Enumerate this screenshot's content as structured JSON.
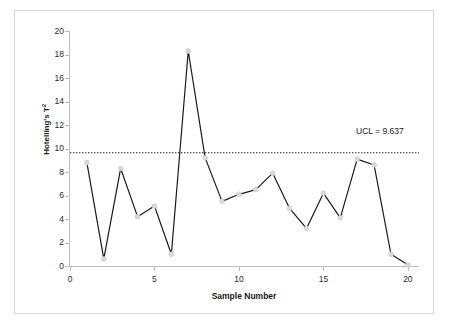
{
  "chart_data": {
    "type": "line",
    "title": "",
    "xlabel": "Sample Number",
    "ylabel": "Hotelling's T²",
    "xlim": [
      0,
      20.6
    ],
    "ylim": [
      0,
      20
    ],
    "xticks": [
      0,
      5,
      10,
      15,
      20
    ],
    "yticks": [
      0,
      2,
      4,
      6,
      8,
      10,
      12,
      14,
      16,
      18,
      20
    ],
    "grid": false,
    "legend": null,
    "x": [
      1,
      2,
      3,
      4,
      5,
      6,
      7,
      8,
      9,
      10,
      11,
      12,
      13,
      14,
      15,
      16,
      17,
      18,
      19,
      20
    ],
    "series": [
      {
        "name": "Hotelling's T²",
        "values": [
          8.8,
          0.6,
          8.3,
          4.2,
          5.1,
          1.0,
          18.3,
          9.2,
          5.5,
          6.1,
          6.5,
          7.9,
          4.9,
          3.2,
          6.2,
          4.1,
          9.1,
          8.6,
          1.0,
          0.1
        ],
        "color": "#1a1a1a",
        "marker": "circle",
        "marker_color": "#d9d9d9"
      }
    ],
    "reference_lines": [
      {
        "name": "UCL",
        "label": "UCL = 9.637",
        "value": 9.637,
        "style": "dotted",
        "color": "#1a1a1a"
      }
    ]
  },
  "ytick_labels": [
    "20",
    "18",
    "16",
    "14",
    "12",
    "10",
    "8",
    "6",
    "4",
    "2",
    "0"
  ],
  "xtick_labels": [
    "0",
    "5",
    "10",
    "15",
    "20"
  ],
  "axis": {
    "ylabel_text": "Hotelling's T",
    "ylabel_sup": "2",
    "xlabel_text": "Sample Number"
  },
  "annotations": {
    "ucl_label": "UCL = 9.637"
  },
  "colors": {
    "frame_border": "#d8d8d8",
    "axis": "#bdbdbd",
    "line": "#1a1a1a",
    "marker_fill": "#e6e6e6",
    "text": "#1a1a1a",
    "background": "#ffffff"
  }
}
